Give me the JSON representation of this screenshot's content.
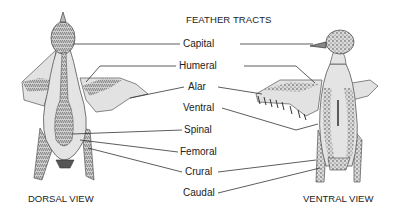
{
  "title": "FEATHER TRACTS",
  "views": {
    "dorsal": "DORSAL VIEW",
    "ventral": "VENTRAL VIEW"
  },
  "tracts": [
    {
      "label": "Capital"
    },
    {
      "label": "Humeral"
    },
    {
      "label": "Alar"
    },
    {
      "label": "Ventral"
    },
    {
      "label": "Spinal"
    },
    {
      "label": "Femoral"
    },
    {
      "label": "Crural"
    },
    {
      "label": "Caudal"
    }
  ],
  "colors": {
    "line": "#333333",
    "body_fill": "#e4e4e4",
    "tract_fill": "#9a9a9a",
    "outline": "#444444"
  }
}
